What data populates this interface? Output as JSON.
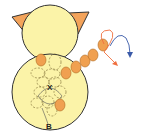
{
  "diagram": {
    "labels": {
      "center_mark": "X",
      "bottom_mark": "B"
    },
    "colors": {
      "body_fill": "#fbf3a8",
      "outline": "#333333",
      "ear_fill": "#f3a35a",
      "segment_fill": "#f0a050",
      "dashed_outline": "#8a7a40",
      "arrow_orange": "#f07040",
      "arrow_blue": "#3a5aa8"
    },
    "segments_count": 6,
    "arrows": [
      "orange-curved-arrow",
      "blue-curved-arrow"
    ]
  }
}
